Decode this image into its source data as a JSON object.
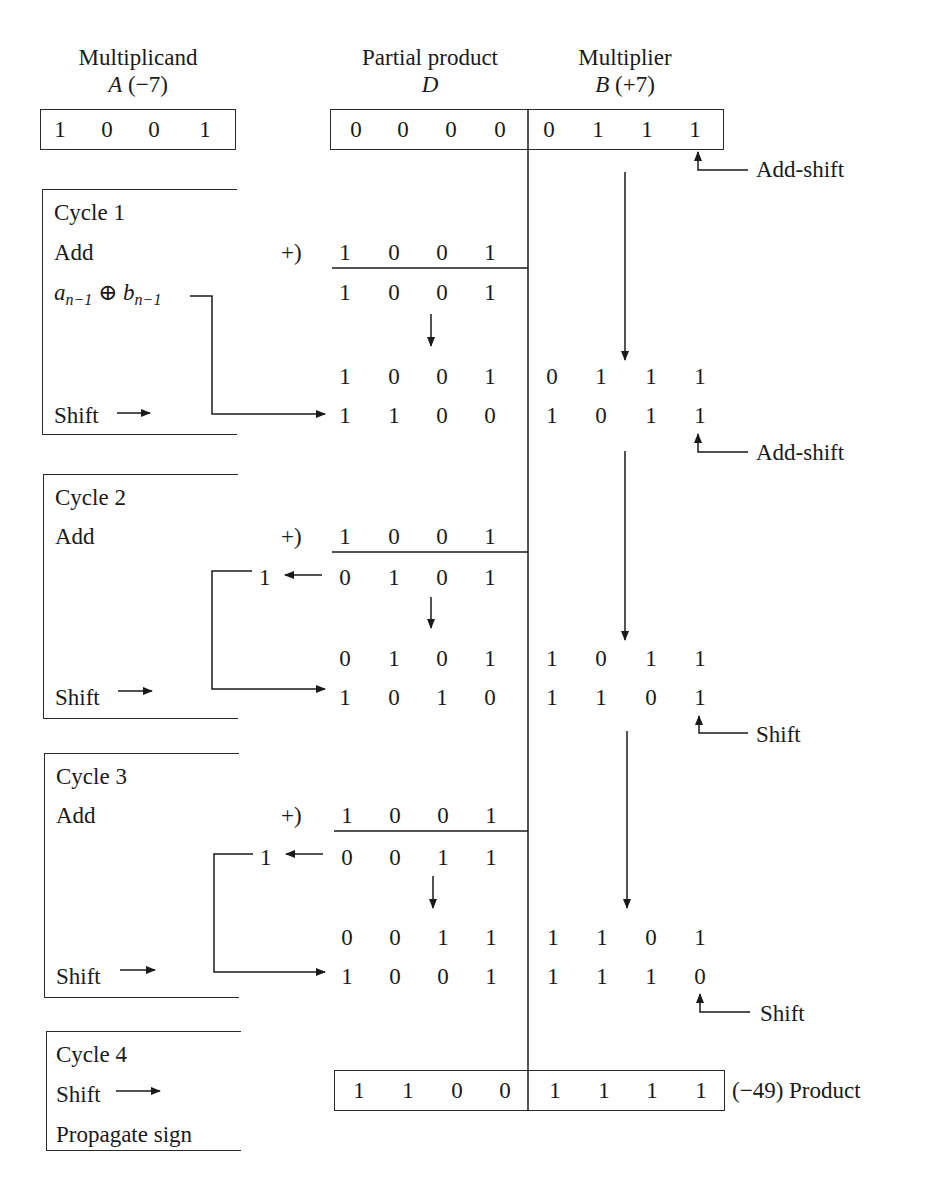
{
  "headers": {
    "multiplicand_title": "Multiplicand",
    "multiplicand_var": "A",
    "multiplicand_val": "(−7)",
    "partial_title": "Partial product",
    "partial_var": "D",
    "multiplier_title": "Multiplier",
    "multiplier_var": "B",
    "multiplier_val": "(+7)"
  },
  "initial": {
    "A": [
      "1",
      "0",
      "0",
      "1"
    ],
    "D": [
      "0",
      "0",
      "0",
      "0"
    ],
    "B": [
      "0",
      "1",
      "1",
      "1"
    ]
  },
  "annotations": {
    "add_shift": "Add-shift",
    "shift": "Shift",
    "plus_sign": "+)",
    "carry": "1",
    "product_label": "(−49) Product",
    "xor_a": "a",
    "xor_sub": "n−1",
    "xor_op": "⊕",
    "xor_b": "b"
  },
  "cycles": [
    {
      "label": "Cycle 1",
      "op": "Add",
      "addend": [
        "1",
        "0",
        "0",
        "1"
      ],
      "sum": [
        "1",
        "0",
        "0",
        "1"
      ],
      "pre_shift_D": [
        "1",
        "0",
        "0",
        "1"
      ],
      "pre_shift_B": [
        "0",
        "1",
        "1",
        "1"
      ],
      "shift_label": "Shift",
      "post_shift_D": [
        "1",
        "1",
        "0",
        "0"
      ],
      "post_shift_B": [
        "1",
        "0",
        "1",
        "1"
      ],
      "action": "Add-shift"
    },
    {
      "label": "Cycle 2",
      "op": "Add",
      "addend": [
        "1",
        "0",
        "0",
        "1"
      ],
      "carry": "1",
      "sum": [
        "0",
        "1",
        "0",
        "1"
      ],
      "pre_shift_D": [
        "0",
        "1",
        "0",
        "1"
      ],
      "pre_shift_B": [
        "1",
        "0",
        "1",
        "1"
      ],
      "shift_label": "Shift",
      "post_shift_D": [
        "1",
        "0",
        "1",
        "0"
      ],
      "post_shift_B": [
        "1",
        "1",
        "0",
        "1"
      ],
      "action": "Add-shift"
    },
    {
      "label": "Cycle 3",
      "op": "Add",
      "addend": [
        "1",
        "0",
        "0",
        "1"
      ],
      "carry": "1",
      "sum": [
        "0",
        "0",
        "1",
        "1"
      ],
      "pre_shift_D": [
        "0",
        "0",
        "1",
        "1"
      ],
      "pre_shift_B": [
        "1",
        "1",
        "0",
        "1"
      ],
      "shift_label": "Shift",
      "post_shift_D": [
        "1",
        "0",
        "0",
        "1"
      ],
      "post_shift_B": [
        "1",
        "1",
        "1",
        "0"
      ],
      "action": "Shift"
    },
    {
      "label": "Cycle 4",
      "op": "Shift",
      "extra": "Propagate sign",
      "product_D": [
        "1",
        "1",
        "0",
        "0"
      ],
      "product_B": [
        "1",
        "1",
        "1",
        "1"
      ]
    }
  ]
}
